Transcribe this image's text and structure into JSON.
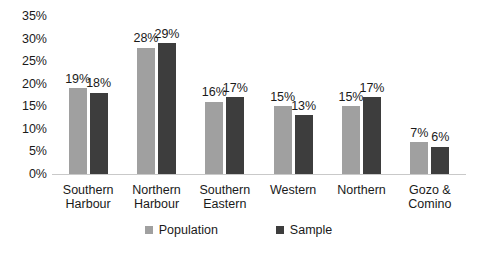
{
  "chart_data": {
    "type": "bar",
    "title": "",
    "xlabel": "",
    "ylabel": "",
    "ylim": [
      0,
      35
    ],
    "grid": false,
    "legend_position": "bottom-center",
    "value_suffix": "%",
    "categories": [
      "Southern Harbour",
      "Northern Harbour",
      "Southern Eastern",
      "Western",
      "Northern",
      "Gozo & Comino"
    ],
    "category_lines": [
      [
        "Southern",
        "Harbour"
      ],
      [
        "Northern",
        "Harbour"
      ],
      [
        "Southern",
        "Eastern"
      ],
      [
        "Western"
      ],
      [
        "Northern"
      ],
      [
        "Gozo &",
        "Comino"
      ]
    ],
    "yticks": [
      "0%",
      "5%",
      "10%",
      "15%",
      "20%",
      "25%",
      "30%",
      "35%"
    ],
    "ytick_values": [
      0,
      5,
      10,
      15,
      20,
      25,
      30,
      35
    ],
    "series": [
      {
        "name": "Population",
        "color": "#a0a0a0",
        "values": [
          19,
          28,
          16,
          15,
          15,
          7
        ],
        "labels": [
          "19%",
          "28%",
          "16%",
          "15%",
          "15%",
          "7%"
        ]
      },
      {
        "name": "Sample",
        "color": "#3d3d3d",
        "values": [
          18,
          29,
          17,
          13,
          17,
          6
        ],
        "labels": [
          "18%",
          "29%",
          "17%",
          "13%",
          "17%",
          "6%"
        ]
      }
    ]
  },
  "legend": {
    "items": [
      {
        "label": "Population",
        "color": "#a0a0a0"
      },
      {
        "label": "Sample",
        "color": "#3d3d3d"
      }
    ]
  },
  "colors": {
    "population": "#a0a0a0",
    "sample": "#3d3d3d",
    "axis": "#c9c9c9",
    "text": "#1a1a1a",
    "background": "#ffffff"
  }
}
